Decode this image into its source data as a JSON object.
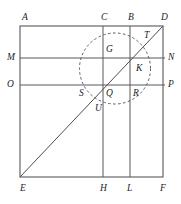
{
  "figure": {
    "type": "euclidean-geometry-diagram",
    "canvas": {
      "width": 181,
      "height": 204
    },
    "colors": {
      "background": "#ffffff",
      "stroke": "#58585a",
      "diagonal": "#4d4d50",
      "dashed": "#5a5a5c",
      "label": "#1d1d1f"
    }
  },
  "labels": {
    "A": "A",
    "B": "B",
    "C": "C",
    "D": "D",
    "E": "E",
    "F": "F",
    "G": "G",
    "H": "H",
    "K": "K",
    "L": "L",
    "M": "M",
    "N": "N",
    "O": "O",
    "P": "P",
    "Q": "Q",
    "R": "R",
    "S": "S",
    "T": "T",
    "U": "U"
  },
  "points": {
    "A": {
      "x": 20,
      "y": 26,
      "label_x": 22,
      "label_y": 18
    },
    "C": {
      "x": 103,
      "y": 26,
      "label_x": 101,
      "label_y": 18
    },
    "B": {
      "x": 130,
      "y": 26,
      "label_x": 128,
      "label_y": 18
    },
    "D": {
      "x": 163,
      "y": 26,
      "label_x": 162,
      "label_y": 18
    },
    "M": {
      "x": 20,
      "y": 58,
      "label_x": 9,
      "label_y": 58
    },
    "N": {
      "x": 163,
      "y": 58,
      "label_x": 168,
      "label_y": 58
    },
    "O": {
      "x": 20,
      "y": 85,
      "label_x": 9,
      "label_y": 85
    },
    "P": {
      "x": 163,
      "y": 85,
      "label_x": 168,
      "label_y": 85
    },
    "E": {
      "x": 20,
      "y": 177,
      "label_x": 20,
      "label_y": 188
    },
    "H": {
      "x": 103,
      "y": 177,
      "label_x": 101,
      "label_y": 188
    },
    "L": {
      "x": 130,
      "y": 177,
      "label_x": 128,
      "label_y": 188
    },
    "F": {
      "x": 163,
      "y": 177,
      "label_x": 162,
      "label_y": 188
    },
    "G": {
      "x": 103,
      "y": 58,
      "label_x": 106,
      "label_y": 50
    },
    "K": {
      "x": 137,
      "y": 62,
      "label_x": 136,
      "label_y": 67
    },
    "Q": {
      "x": 103,
      "y": 85,
      "label_x": 106,
      "label_y": 92
    },
    "R": {
      "x": 130,
      "y": 85,
      "label_x": 133,
      "label_y": 92
    },
    "S": {
      "x": 80,
      "y": 85,
      "label_x": 79,
      "label_y": 92
    },
    "T": {
      "x": 143,
      "y": 37,
      "label_x": 144,
      "label_y": 34
    },
    "U": {
      "x": 103,
      "y": 104,
      "label_x": 97,
      "label_y": 108
    }
  },
  "segments": {
    "rectangle": {
      "name": "ADFE",
      "x1": 20,
      "y1": 26,
      "x2": 163,
      "y2": 177
    },
    "vertical_CH": {
      "name": "CH",
      "x": 103,
      "y1": 26,
      "y2": 177
    },
    "vertical_BL": {
      "name": "BL",
      "x": 130,
      "y1": 26,
      "y2": 177
    },
    "horizontal_MN": {
      "name": "MN",
      "y": 58,
      "x1": 20,
      "x2": 163
    },
    "horizontal_OP": {
      "name": "OP",
      "y": 85,
      "x1": 20,
      "x2": 163
    },
    "diagonal_ED": {
      "name": "ED",
      "x1": 20,
      "y1": 177,
      "x2": 163,
      "y2": 26
    }
  },
  "circle": {
    "name": "dashed-circle",
    "cx": 115,
    "cy": 68.5,
    "r": 35.5,
    "style": "dashed"
  }
}
